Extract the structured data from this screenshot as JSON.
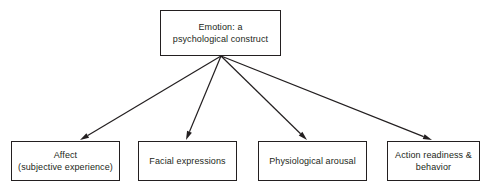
{
  "diagram": {
    "type": "hierarchy-fan-out",
    "root": {
      "id": "emotion-root",
      "label": "Emotion: a\npsychological construct",
      "box": {
        "x": 160,
        "y": 10,
        "w": 121,
        "h": 46
      }
    },
    "hub": {
      "x": 221,
      "y": 56
    },
    "children": [
      {
        "id": "affect",
        "label": "Affect\n(subjective experience)",
        "box": {
          "x": 11,
          "y": 141,
          "w": 109,
          "h": 40
        },
        "arrow_tip": {
          "x": 80,
          "y": 140
        }
      },
      {
        "id": "facial-expressions",
        "label": "Facial expressions",
        "box": {
          "x": 138,
          "y": 141,
          "w": 99,
          "h": 40
        },
        "arrow_tip": {
          "x": 186,
          "y": 140
        }
      },
      {
        "id": "physiological-arousal",
        "label": "Physiological arousal",
        "box": {
          "x": 258,
          "y": 141,
          "w": 109,
          "h": 40
        },
        "arrow_tip": {
          "x": 307,
          "y": 140
        }
      },
      {
        "id": "action-readiness",
        "label": "Action readiness &\nbehavior",
        "box": {
          "x": 387,
          "y": 141,
          "w": 93,
          "h": 40
        },
        "arrow_tip": {
          "x": 432,
          "y": 140
        }
      }
    ],
    "colors": {
      "stroke": "#231f20",
      "background": "#ffffff",
      "text": "#231f20"
    }
  }
}
